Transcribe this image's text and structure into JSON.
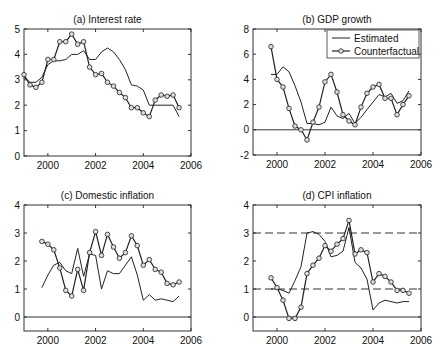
{
  "chart_data": [
    {
      "id": "a",
      "type": "line",
      "title": "(a) Interest rate",
      "xlabel": "",
      "ylabel": "",
      "xlim": [
        1999,
        2006
      ],
      "ylim": [
        0,
        5
      ],
      "xticks": [
        2000,
        2002,
        2004,
        2006
      ],
      "yticks": [
        0,
        1,
        2,
        3,
        4,
        5
      ],
      "grid": false,
      "series": [
        {
          "name": "Estimated",
          "style": "line",
          "x": [
            1999.0,
            1999.25,
            1999.5,
            1999.75,
            2000.0,
            2000.25,
            2000.5,
            2000.75,
            2001.0,
            2001.25,
            2001.5,
            2001.75,
            2002.0,
            2002.25,
            2002.5,
            2002.75,
            2003.0,
            2003.25,
            2003.5,
            2003.75,
            2004.0,
            2004.25,
            2004.5,
            2004.75,
            2005.0,
            2005.25,
            2005.5
          ],
          "y": [
            3.1,
            2.9,
            2.9,
            3.1,
            3.6,
            3.75,
            3.75,
            3.8,
            4.0,
            4.0,
            4.15,
            3.8,
            3.8,
            4.1,
            4.25,
            4.1,
            3.8,
            3.4,
            2.8,
            2.75,
            2.6,
            2.0,
            2.0,
            2.0,
            2.0,
            2.0,
            1.55
          ]
        },
        {
          "name": "Counterfactual",
          "style": "line-marker",
          "x": [
            1999.0,
            1999.25,
            1999.5,
            1999.75,
            2000.0,
            2000.25,
            2000.5,
            2000.75,
            2001.0,
            2001.25,
            2001.5,
            2001.75,
            2002.0,
            2002.25,
            2002.5,
            2002.75,
            2003.0,
            2003.25,
            2003.5,
            2003.75,
            2004.0,
            2004.25,
            2004.5,
            2004.75,
            2005.0,
            2005.25,
            2005.5
          ],
          "y": [
            3.2,
            2.8,
            2.7,
            2.9,
            3.8,
            3.8,
            4.5,
            4.5,
            4.8,
            4.4,
            4.5,
            3.5,
            3.2,
            3.25,
            2.9,
            2.75,
            2.5,
            2.3,
            1.9,
            1.9,
            1.7,
            1.55,
            2.2,
            2.4,
            2.35,
            2.4,
            1.9
          ]
        }
      ]
    },
    {
      "id": "b",
      "type": "line",
      "title": "(b) GDP growth",
      "xlabel": "",
      "ylabel": "",
      "xlim": [
        1999,
        2006
      ],
      "ylim": [
        -2,
        8
      ],
      "xticks": [
        2000,
        2002,
        2004,
        2006
      ],
      "yticks": [
        -2,
        0,
        2,
        4,
        6,
        8
      ],
      "grid": false,
      "hlines": [
        {
          "y": 0,
          "style": "solid"
        }
      ],
      "legend": {
        "position": "upper right",
        "entries": [
          "Estimated",
          "Counterfactual"
        ]
      },
      "series": [
        {
          "name": "Estimated",
          "style": "line",
          "x": [
            1999.75,
            2000.0,
            2000.25,
            2000.5,
            2000.75,
            2001.0,
            2001.25,
            2001.5,
            2001.75,
            2002.0,
            2002.25,
            2002.5,
            2002.75,
            2003.0,
            2003.25,
            2003.5,
            2003.75,
            2004.0,
            2004.25,
            2004.5,
            2004.75,
            2005.0,
            2005.25,
            2005.5
          ],
          "y": [
            4.4,
            4.4,
            5.0,
            4.6,
            3.5,
            2.2,
            0.5,
            0.5,
            0.4,
            0.6,
            1.8,
            1.1,
            0.9,
            1.3,
            0.5,
            1.0,
            1.6,
            2.2,
            2.8,
            2.6,
            2.9,
            2.1,
            2.3,
            3.1
          ]
        },
        {
          "name": "Counterfactual",
          "style": "line-marker",
          "x": [
            1999.75,
            2000.0,
            2000.25,
            2000.5,
            2000.75,
            2001.0,
            2001.25,
            2001.5,
            2001.75,
            2002.0,
            2002.25,
            2002.5,
            2002.75,
            2003.0,
            2003.25,
            2003.5,
            2003.75,
            2004.0,
            2004.25,
            2004.5,
            2004.75,
            2005.0,
            2005.25,
            2005.5
          ],
          "y": [
            6.6,
            4.0,
            3.4,
            1.7,
            0.3,
            0.0,
            -0.8,
            0.6,
            1.8,
            3.8,
            4.4,
            3.0,
            1.2,
            0.7,
            0.4,
            1.8,
            2.9,
            3.4,
            3.6,
            2.5,
            2.5,
            1.2,
            2.0,
            2.7
          ]
        }
      ]
    },
    {
      "id": "c",
      "type": "line",
      "title": "(c) Domestic inflation",
      "xlabel": "",
      "ylabel": "",
      "xlim": [
        1999,
        2006
      ],
      "ylim": [
        -0.5,
        4
      ],
      "xticks": [
        2000,
        2002,
        2004,
        2006
      ],
      "yticks": [
        0,
        1,
        2,
        3,
        4
      ],
      "grid": false,
      "hlines": [
        {
          "y": 0,
          "style": "solid"
        }
      ],
      "series": [
        {
          "name": "Estimated",
          "style": "line",
          "x": [
            1999.75,
            2000.0,
            2000.25,
            2000.5,
            2000.75,
            2001.0,
            2001.25,
            2001.5,
            2001.75,
            2002.0,
            2002.25,
            2002.5,
            2002.75,
            2003.0,
            2003.25,
            2003.5,
            2003.75,
            2004.0,
            2004.25,
            2004.5,
            2004.75,
            2005.0,
            2005.25,
            2005.5
          ],
          "y": [
            1.05,
            1.5,
            1.85,
            1.95,
            1.65,
            1.55,
            2.45,
            1.45,
            2.25,
            2.2,
            1.0,
            1.65,
            1.55,
            1.55,
            1.85,
            2.15,
            1.5,
            0.6,
            0.8,
            0.6,
            0.65,
            0.6,
            0.55,
            0.75
          ]
        },
        {
          "name": "Counterfactual",
          "style": "line-marker",
          "x": [
            1999.75,
            2000.0,
            2000.25,
            2000.5,
            2000.75,
            2001.0,
            2001.25,
            2001.5,
            2001.75,
            2002.0,
            2002.25,
            2002.5,
            2002.75,
            2003.0,
            2003.25,
            2003.5,
            2003.75,
            2004.0,
            2004.25,
            2004.5,
            2004.75,
            2005.0,
            2005.25,
            2005.5
          ],
          "y": [
            2.7,
            2.6,
            2.4,
            1.75,
            0.95,
            0.75,
            1.7,
            0.95,
            2.3,
            3.05,
            2.2,
            2.95,
            2.5,
            2.1,
            2.3,
            2.9,
            2.55,
            1.85,
            2.05,
            1.7,
            1.6,
            1.2,
            1.15,
            1.25
          ]
        }
      ]
    },
    {
      "id": "d",
      "type": "line",
      "title": "(d) CPI inflation",
      "xlabel": "",
      "ylabel": "",
      "xlim": [
        1999,
        2006
      ],
      "ylim": [
        -0.5,
        4
      ],
      "xticks": [
        2000,
        2002,
        2004,
        2006
      ],
      "yticks": [
        0,
        1,
        2,
        3,
        4
      ],
      "grid": false,
      "hlines": [
        {
          "y": 0,
          "style": "solid"
        },
        {
          "y": 1,
          "style": "dashed"
        },
        {
          "y": 3,
          "style": "dashed"
        }
      ],
      "series": [
        {
          "name": "Estimated",
          "style": "line",
          "x": [
            1999.75,
            2000.0,
            2000.25,
            2000.5,
            2000.75,
            2001.0,
            2001.25,
            2001.5,
            2001.75,
            2002.0,
            2002.25,
            2002.5,
            2002.75,
            2003.0,
            2003.25,
            2003.5,
            2003.75,
            2004.0,
            2004.25,
            2004.5,
            2004.75,
            2005.0,
            2005.25,
            2005.5
          ],
          "y": [
            1.0,
            1.0,
            0.95,
            0.85,
            1.3,
            1.8,
            3.0,
            3.05,
            2.95,
            2.7,
            2.15,
            2.2,
            2.35,
            3.2,
            1.95,
            1.75,
            1.35,
            0.25,
            0.5,
            0.6,
            0.55,
            0.5,
            0.55,
            0.55
          ]
        },
        {
          "name": "Counterfactual",
          "style": "line-marker",
          "x": [
            1999.75,
            2000.0,
            2000.25,
            2000.5,
            2000.75,
            2001.0,
            2001.25,
            2001.5,
            2001.75,
            2002.0,
            2002.25,
            2002.5,
            2002.75,
            2003.0,
            2003.25,
            2003.5,
            2003.75,
            2004.0,
            2004.25,
            2004.5,
            2004.75,
            2005.0,
            2005.25,
            2005.5
          ],
          "y": [
            1.4,
            1.05,
            0.6,
            -0.05,
            -0.05,
            0.35,
            1.55,
            1.85,
            2.1,
            2.55,
            2.35,
            2.6,
            2.8,
            3.45,
            2.25,
            2.4,
            2.3,
            1.25,
            1.55,
            1.45,
            1.25,
            0.95,
            0.95,
            0.85
          ]
        }
      ]
    }
  ],
  "panels": [
    {
      "title": "(a) Interest rate",
      "box": [
        24,
        29,
        191,
        156
      ]
    },
    {
      "title": "(b) GDP growth",
      "box": [
        253,
        29,
        421,
        155
      ]
    },
    {
      "title": "(c) Domestic inflation",
      "box": [
        24,
        205,
        191,
        331
      ]
    },
    {
      "title": "(d) CPI inflation",
      "box": [
        253,
        205,
        421,
        331
      ]
    }
  ],
  "legend": {
    "estimated_label": "Estimated",
    "counterfactual_label": "Counterfactual"
  }
}
